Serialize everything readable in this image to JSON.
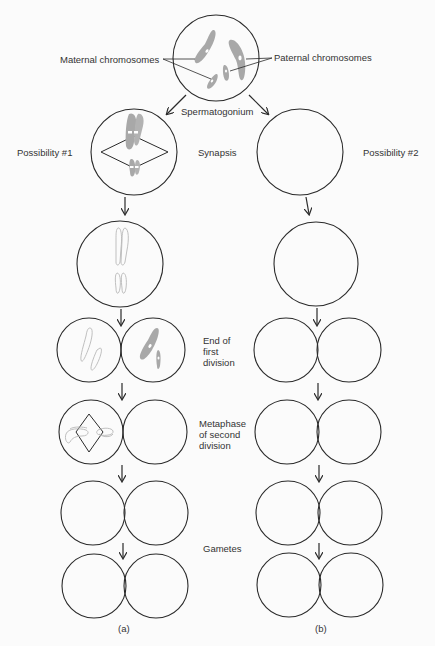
{
  "labels": {
    "maternal": "Maternal chromosomes",
    "paternal": "Paternal chromosomes",
    "spermatogonium": "Spermatogonium",
    "possibility1": "Possibility #1",
    "possibility2": "Possibility #2",
    "synapsis": "Synapsis",
    "end_first_1": "End of",
    "end_first_2": "first",
    "end_first_3": "division",
    "meta_second_1": "Metaphase",
    "meta_second_2": "of second",
    "meta_second_3": "division",
    "gametes": "Gametes",
    "panel_a": "(a)",
    "panel_b": "(b)"
  },
  "colors": {
    "stroke": "#2a2a2a",
    "chromosome": "#a8a8a8",
    "chromosome_outline": "#b8b8b8",
    "background": "#fbfbfb"
  }
}
